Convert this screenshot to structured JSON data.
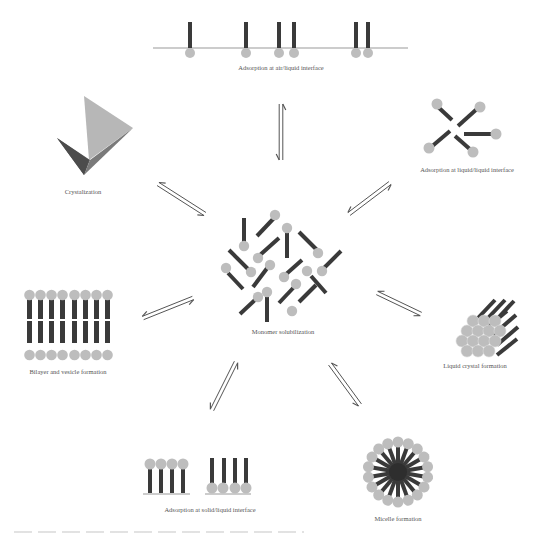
{
  "diagram": {
    "center": {
      "label": "Monomer solubilization",
      "x": 283,
      "y": 332
    },
    "nodes": [
      {
        "id": "air-liquid",
        "label": "Adsorption at air/liquid interface",
        "x": 281,
        "y": 68
      },
      {
        "id": "liquid-liquid",
        "label": "Adsorption at liquid/liquid interface",
        "x": 467,
        "y": 171
      },
      {
        "id": "liquid-crystal",
        "label": "Liquid crystal formation",
        "x": 475,
        "y": 367
      },
      {
        "id": "micelle",
        "label": "Micelle formation",
        "x": 398,
        "y": 520
      },
      {
        "id": "solid-liquid",
        "label": "Adsorption at solid/liquid interface",
        "x": 210,
        "y": 510
      },
      {
        "id": "bilayer",
        "label": "Bilayer and vesicle formation",
        "x": 68,
        "y": 373
      },
      {
        "id": "crystal",
        "label": "Crystalization",
        "x": 83,
        "y": 193
      }
    ],
    "arrows": [
      {
        "to": "air-liquid",
        "x1": 281,
        "y1": 104,
        "x2": 281,
        "y2": 160
      },
      {
        "to": "liquid-liquid",
        "x1": 390,
        "y1": 183,
        "x2": 349,
        "y2": 214
      },
      {
        "to": "liquid-crystal",
        "x1": 377,
        "y1": 293,
        "x2": 421,
        "y2": 314
      },
      {
        "to": "micelle",
        "x1": 330,
        "y1": 364,
        "x2": 360,
        "y2": 405
      },
      {
        "to": "solid-liquid",
        "x1": 236,
        "y1": 362,
        "x2": 212,
        "y2": 410
      },
      {
        "to": "bilayer",
        "x1": 193,
        "y1": 298,
        "x2": 143,
        "y2": 318
      },
      {
        "to": "crystal",
        "x1": 158,
        "y1": 184,
        "x2": 205,
        "y2": 214
      }
    ],
    "colors": {
      "tail": "#3a3a3a",
      "head": "#bdbdbd",
      "interface_line": "#9a9a9a",
      "arrow": "#555555",
      "label": "#555555",
      "crystal_light": "#b7b7b7",
      "crystal_dark": "#5a5a5a",
      "crystal_mid": "#8a8a8a"
    }
  }
}
